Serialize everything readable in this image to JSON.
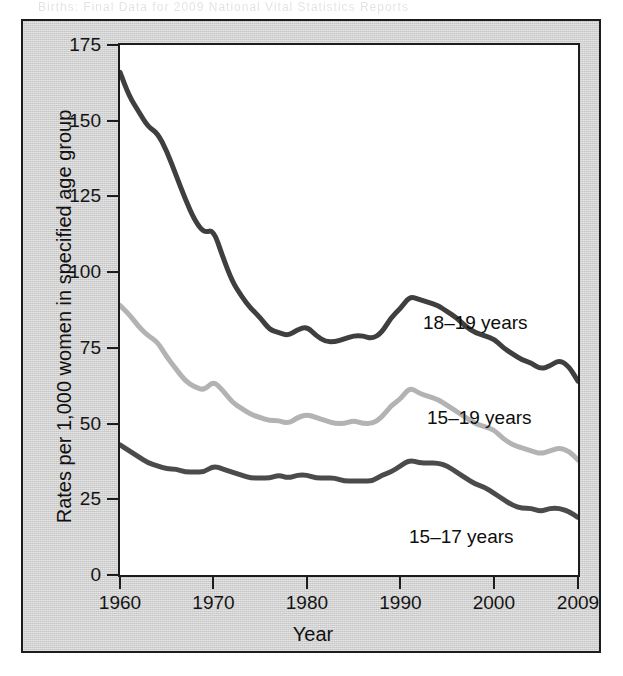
{
  "figure": {
    "scan_artifact_text": "Births: Final Data for 2009   National Vital Statistics Reports",
    "panel_bg_color": "#d2d2d2",
    "plot_bg_color": "#ffffff",
    "frame_color": "#1c1c1c"
  },
  "axes": {
    "y_title": "Rates per 1,000 women in specified age group",
    "x_title": "Year",
    "y_ticks": [
      0,
      25,
      50,
      75,
      100,
      125,
      150,
      175
    ],
    "y_tick_labels": [
      "0",
      "25",
      "50",
      "75",
      "100",
      "125",
      "150",
      "175"
    ],
    "x_ticks": [
      1960,
      1970,
      1980,
      1990,
      2000,
      2009
    ],
    "x_tick_labels": [
      "1960",
      "1970",
      "1980",
      "1990",
      "2000",
      "2009"
    ]
  },
  "series_labels": {
    "age_18_19": "18–19 years",
    "age_15_19": "15–19 years",
    "age_15_17": "15–17 years"
  },
  "chart_data": {
    "type": "line",
    "title": "",
    "subtitle": "",
    "xlabel": "Year",
    "ylabel": "Rates per 1,000 women in specified age group",
    "xlim": [
      1960,
      2009
    ],
    "ylim": [
      0,
      175
    ],
    "grid": false,
    "legend": "inline-labels-right",
    "x": [
      1960,
      1961,
      1962,
      1963,
      1964,
      1965,
      1966,
      1967,
      1968,
      1969,
      1970,
      1971,
      1972,
      1973,
      1974,
      1975,
      1976,
      1977,
      1978,
      1979,
      1980,
      1981,
      1982,
      1983,
      1984,
      1985,
      1986,
      1987,
      1988,
      1989,
      1990,
      1991,
      1992,
      1993,
      1994,
      1995,
      1996,
      1997,
      1998,
      1999,
      2000,
      2001,
      2002,
      2003,
      2004,
      2005,
      2006,
      2007,
      2008,
      2009
    ],
    "series": [
      {
        "name": "18–19 years",
        "color": "#3f3f3f",
        "values": [
          166.0,
          158.0,
          153.0,
          148.0,
          146.0,
          140.0,
          132.0,
          124.0,
          117.0,
          113.0,
          114.0,
          105.0,
          97.0,
          92.0,
          88.0,
          85.0,
          81.0,
          80.0,
          79.0,
          81.0,
          82.0,
          79.0,
          77.0,
          77.0,
          78.0,
          79.0,
          79.0,
          78.0,
          80.0,
          85.0,
          88.0,
          92.0,
          91.0,
          90.0,
          89.0,
          87.0,
          85.0,
          82.0,
          80.0,
          79.0,
          78.0,
          75.0,
          73.0,
          71.0,
          70.0,
          68.0,
          69.0,
          71.0,
          69.0,
          64.0
        ]
      },
      {
        "name": "15–19 years",
        "color": "#b3b3b3",
        "values": [
          89.0,
          86.0,
          82.0,
          79.0,
          77.0,
          72.0,
          68.0,
          64.0,
          62.0,
          61.0,
          64.0,
          61.0,
          57.0,
          55.0,
          53.0,
          52.0,
          51.0,
          51.0,
          50.0,
          52.0,
          53.0,
          52.0,
          51.0,
          50.0,
          50.0,
          51.0,
          50.0,
          50.0,
          52.0,
          56.0,
          58.0,
          62.0,
          60.0,
          59.0,
          58.0,
          56.0,
          54.0,
          52.0,
          50.0,
          49.0,
          48.0,
          45.0,
          43.0,
          42.0,
          41.0,
          40.0,
          41.0,
          42.0,
          41.0,
          38.0
        ]
      },
      {
        "name": "15–17 years",
        "color": "#4b4b4b",
        "values": [
          43.0,
          41.0,
          39.0,
          37.0,
          36.0,
          35.0,
          35.0,
          34.0,
          34.0,
          34.0,
          36.0,
          35.0,
          34.0,
          33.0,
          32.0,
          32.0,
          32.0,
          33.0,
          32.0,
          33.0,
          33.0,
          32.0,
          32.0,
          32.0,
          31.0,
          31.0,
          31.0,
          31.0,
          33.0,
          34.0,
          36.0,
          38.0,
          37.0,
          37.0,
          37.0,
          36.0,
          34.0,
          32.0,
          30.0,
          29.0,
          27.0,
          25.0,
          23.0,
          22.0,
          22.0,
          21.0,
          22.0,
          22.0,
          21.0,
          19.0
        ]
      }
    ]
  }
}
